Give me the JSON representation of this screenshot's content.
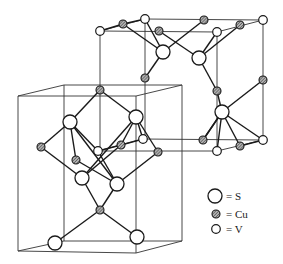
{
  "diagram": {
    "type": "crystal-structure",
    "cells": [
      {
        "name": "lower-left-cell",
        "vertices": {
          "top": [
            [
              64,
              85
            ],
            [
              182,
              85
            ],
            [
              136,
              96
            ],
            [
              18,
              96
            ]
          ],
          "bottom": [
            [
              64,
              241
            ],
            [
              182,
              241
            ],
            [
              136,
              253
            ],
            [
              18,
              251
            ]
          ]
        }
      },
      {
        "name": "upper-right-cell",
        "vertices": {
          "top": [
            [
              145,
              19
            ],
            [
              263,
              20
            ],
            [
              217,
              32
            ],
            [
              100,
              31
            ]
          ],
          "bottom": [
            [
              145,
              141
            ],
            [
              263,
              141
            ],
            [
              217,
              151
            ],
            [
              100,
              152
            ]
          ]
        }
      }
    ],
    "atoms": {
      "S": [
        [
          163,
          52
        ],
        [
          199,
          58
        ],
        [
          222,
          112
        ],
        [
          70,
          122
        ],
        [
          136,
          117
        ],
        [
          82,
          178
        ],
        [
          117,
          184
        ],
        [
          55,
          243
        ],
        [
          137,
          237
        ]
      ],
      "Cu": [
        [
          123,
          24
        ],
        [
          204,
          20
        ],
        [
          240,
          25
        ],
        [
          159,
          31
        ],
        [
          145,
          78
        ],
        [
          217,
          91
        ],
        [
          263,
          80
        ],
        [
          100,
          90
        ],
        [
          41,
          147
        ],
        [
          76,
          160
        ],
        [
          121,
          145
        ],
        [
          158,
          152
        ],
        [
          203,
          140
        ],
        [
          240,
          146
        ],
        [
          100,
          210
        ]
      ],
      "V": [
        [
          100,
          31
        ],
        [
          145,
          19
        ],
        [
          263,
          20
        ],
        [
          217,
          32
        ],
        [
          98,
          151
        ],
        [
          143,
          139
        ],
        [
          217,
          151
        ],
        [
          263,
          140
        ]
      ]
    },
    "bonds": [
      [
        [
          123,
          24
        ],
        [
          163,
          52
        ]
      ],
      [
        [
          159,
          31
        ],
        [
          199,
          58
        ]
      ],
      [
        [
          204,
          20
        ],
        [
          163,
          52
        ]
      ],
      [
        [
          240,
          25
        ],
        [
          199,
          58
        ]
      ],
      [
        [
          145,
          19
        ],
        [
          163,
          52
        ]
      ],
      [
        [
          217,
          32
        ],
        [
          199,
          58
        ]
      ],
      [
        [
          163,
          52
        ],
        [
          145,
          78
        ]
      ],
      [
        [
          199,
          58
        ],
        [
          217,
          91
        ]
      ],
      [
        [
          263,
          80
        ],
        [
          222,
          112
        ]
      ],
      [
        [
          222,
          112
        ],
        [
          203,
          140
        ]
      ],
      [
        [
          222,
          112
        ],
        [
          240,
          146
        ]
      ],
      [
        [
          222,
          112
        ],
        [
          263,
          140
        ]
      ],
      [
        [
          222,
          112
        ],
        [
          217,
          151
        ]
      ],
      [
        [
          100,
          90
        ],
        [
          70,
          122
        ]
      ],
      [
        [
          100,
          90
        ],
        [
          136,
          117
        ]
      ],
      [
        [
          70,
          122
        ],
        [
          41,
          147
        ]
      ],
      [
        [
          70,
          122
        ],
        [
          98,
          151
        ]
      ],
      [
        [
          70,
          122
        ],
        [
          117,
          184
        ]
      ],
      [
        [
          136,
          117
        ],
        [
          121,
          145
        ]
      ],
      [
        [
          136,
          117
        ],
        [
          158,
          152
        ]
      ],
      [
        [
          136,
          117
        ],
        [
          82,
          178
        ]
      ],
      [
        [
          136,
          117
        ],
        [
          143,
          139
        ]
      ],
      [
        [
          41,
          147
        ],
        [
          82,
          178
        ]
      ],
      [
        [
          76,
          160
        ],
        [
          117,
          184
        ]
      ],
      [
        [
          76,
          160
        ],
        [
          70,
          122
        ]
      ],
      [
        [
          158,
          152
        ],
        [
          117,
          184
        ]
      ],
      [
        [
          121,
          145
        ],
        [
          82,
          178
        ]
      ],
      [
        [
          82,
          178
        ],
        [
          100,
          210
        ]
      ],
      [
        [
          117,
          184
        ],
        [
          100,
          210
        ]
      ],
      [
        [
          100,
          210
        ],
        [
          55,
          243
        ]
      ],
      [
        [
          100,
          210
        ],
        [
          137,
          237
        ]
      ],
      [
        [
          98,
          151
        ],
        [
          117,
          184
        ]
      ],
      [
        [
          143,
          139
        ],
        [
          121,
          145
        ]
      ]
    ]
  },
  "legend": {
    "items": [
      {
        "symbol": "large-open-circle",
        "label": "= S"
      },
      {
        "symbol": "hatched-circle",
        "label": "= Cu"
      },
      {
        "symbol": "small-open-circle",
        "label": "= V"
      }
    ]
  },
  "colors": {
    "line": "#1a1a1a",
    "cu_fill": "#8a8a8a",
    "background": "#ffffff"
  }
}
